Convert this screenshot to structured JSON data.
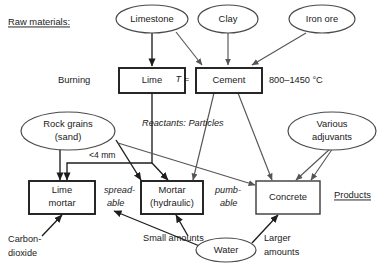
{
  "diagram": {
    "title_left": "Raw materials:",
    "title_right": "Products",
    "stage_label": "Burning",
    "temperature_prefix": "T =",
    "temperature_range": "800–1450 °C",
    "reactants_label": "Reactants: Particles",
    "grain_size_label": "<4 mm",
    "spreadable_line1": "spread-",
    "spreadable_line2": "able",
    "pumpable_line1": "pumb-",
    "pumpable_line2": "able",
    "carbon_dioxide_line1": "Carbon-",
    "carbon_dioxide_line2": "dioxide",
    "small_amounts": "Small amounts",
    "larger_amounts_line1": "Larger",
    "larger_amounts_line2": "amounts",
    "nodes": {
      "limestone": "Limestone",
      "clay": "Clay",
      "iron_ore": "Iron ore",
      "lime": "Lime",
      "cement": "Cement",
      "rock_grains_line1": "Rock grains",
      "rock_grains_line2": "(sand)",
      "various_adjuvants_line1": "Various",
      "various_adjuvants_line2": "adjuvants",
      "lime_mortar_line1": "Lime",
      "lime_mortar_line2": "mortar",
      "mortar_line1": "Mortar",
      "mortar_line2": "(hydraulic)",
      "concrete": "Concrete",
      "water": "Water"
    },
    "colors": {
      "background": "#ffffff",
      "text": "#1a1a1a",
      "edge": "#555555",
      "edge_dark": "#1d1d1d",
      "box_stroke": "#3a3a3a",
      "ellipse_stroke": "#4a4a4a"
    }
  }
}
